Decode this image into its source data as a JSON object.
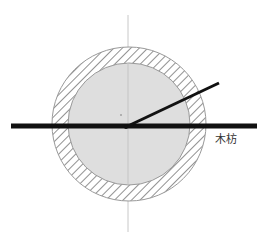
{
  "diagram": {
    "title": "",
    "width": 266,
    "height": 243,
    "center": {
      "x": 128,
      "y": 125
    },
    "outer_circle": {
      "r": 77,
      "style": "hatched",
      "hatch_color": "#555555",
      "stroke": "#9a9a9a"
    },
    "inner_circle": {
      "r": 61,
      "fill": "#dedede",
      "stroke": "#9a9a9a"
    },
    "centerline": {
      "x": 128,
      "y1": 15,
      "y2": 232,
      "color": "#c8c8c8"
    },
    "beam": {
      "x1": 11,
      "x2": 257,
      "y": 126,
      "thickness": 5,
      "color": "#111111"
    },
    "angled_line": {
      "x1": 130,
      "y1": 125,
      "x2": 219,
      "y2": 83,
      "thickness": 3,
      "color": "#111111"
    },
    "labels": [
      {
        "id": "beam-label",
        "text": "木枋",
        "x": 215,
        "y": 143
      }
    ],
    "colors": {
      "background": "#ffffff",
      "hatch": "#555555",
      "fill": "#dedede",
      "beam": "#111111"
    }
  }
}
